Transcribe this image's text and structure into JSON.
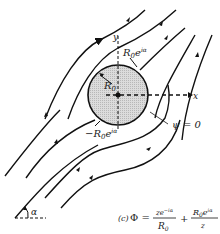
{
  "figure": {
    "caption_prefix": "(c)",
    "equation": {
      "lhs": "Φ =",
      "term1_num": "ze",
      "term1_num_sup": "−iα",
      "term1_den": "R",
      "term1_den_sub": "0",
      "plus": "+",
      "term2_num": "R",
      "term2_num_sub": "0",
      "term2_num_mid": "e",
      "term2_num_sup": "iα",
      "term2_den": "z"
    },
    "labels": {
      "y_axis": "y",
      "x_axis": "x",
      "radius": "R",
      "radius_sub": "0",
      "top_point": "R",
      "top_point_sub": "0",
      "top_point_exp": "e",
      "top_point_sup": "iα",
      "bottom_point": "−R",
      "bottom_point_sub": "0",
      "bottom_point_exp": "e",
      "bottom_point_sup": "iα",
      "streamline": "ψ = 0",
      "angle": "α"
    },
    "colors": {
      "cylinder_fill": "#d4d4d4",
      "ink": "#111111"
    }
  }
}
